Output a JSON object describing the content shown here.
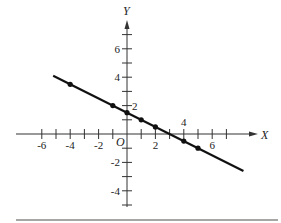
{
  "chart_data": {
    "type": "line",
    "title": "",
    "xlabel": "X",
    "ylabel": "Y",
    "origin_label": "O",
    "xlim": [
      -7,
      9
    ],
    "ylim": [
      -5,
      8
    ],
    "x_tick_labels": [
      "-6",
      "-4",
      "-2",
      "2",
      "4",
      "6"
    ],
    "y_tick_labels": [
      "6",
      "4",
      "2",
      "-2",
      "-4"
    ],
    "grid": false,
    "series": [
      {
        "name": "line",
        "equation": "y = 1.5 - 0.5x",
        "line_extent": {
          "x_start": -5.2,
          "x_end": 8.2
        },
        "points": [
          {
            "x": -4,
            "y": 3.5
          },
          {
            "x": -1,
            "y": 2
          },
          {
            "x": 0,
            "y": 1.5
          },
          {
            "x": 1,
            "y": 1
          },
          {
            "x": 2,
            "y": 0.5
          },
          {
            "x": 4,
            "y": -0.5
          },
          {
            "x": 5,
            "y": -1
          }
        ]
      }
    ],
    "colors": {
      "line": "#111111",
      "axis": "#333333",
      "rule": "#888888"
    }
  }
}
